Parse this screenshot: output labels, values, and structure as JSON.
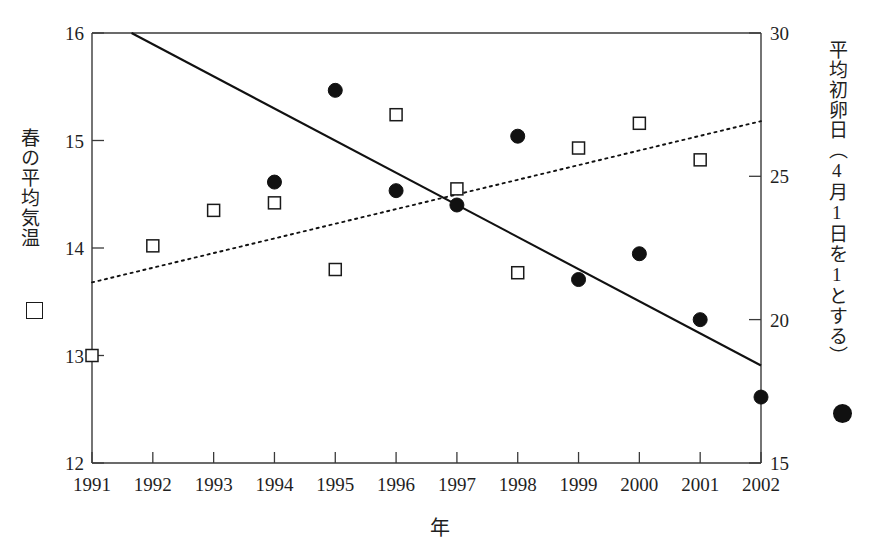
{
  "chart_data": {
    "type": "scatter",
    "title": "",
    "xlabel": "年",
    "x": [
      1991,
      1992,
      1993,
      1994,
      1995,
      1996,
      1997,
      1998,
      1999,
      2000,
      2001,
      2002
    ],
    "xtick_labels": [
      "1991",
      "1992",
      "1993",
      "1994",
      "1995",
      "1996",
      "1997",
      "1998",
      "1999",
      "2000",
      "2001",
      "2002"
    ],
    "xlim": [
      1991,
      2002
    ],
    "grid": false,
    "legend_position": "outside-left-and-right",
    "left_axis": {
      "label": "春の平均気温",
      "marker": "open-square",
      "ylim": [
        12,
        16
      ],
      "ticks": [
        12,
        13,
        14,
        15,
        16
      ],
      "tick_labels": [
        "12",
        "13",
        "14",
        "15",
        "16"
      ]
    },
    "right_axis": {
      "label": "平均初卵日（4月1日を1とする）",
      "marker": "filled-circle",
      "ylim": [
        15,
        30
      ],
      "ticks": [
        15,
        20,
        25,
        30
      ],
      "tick_labels": [
        "15",
        "20",
        "25",
        "30"
      ]
    },
    "series": [
      {
        "name": "春の平均気温",
        "axis": "left",
        "marker": "open-square",
        "x": [
          1991,
          1992,
          1993,
          1994,
          1995,
          1996,
          1997,
          1998,
          1999,
          2000,
          2001
        ],
        "values": [
          13.0,
          14.02,
          14.35,
          14.42,
          13.8,
          15.24,
          14.55,
          13.77,
          14.93,
          15.16,
          14.82
        ]
      },
      {
        "name": "平均初卵日",
        "axis": "right",
        "marker": "filled-circle",
        "x": [
          1994,
          1995,
          1996,
          1997,
          1998,
          1999,
          2000,
          2001,
          2002
        ],
        "values": [
          24.8,
          28.0,
          24.5,
          24.0,
          26.4,
          21.4,
          22.3,
          20.0,
          17.3
        ]
      }
    ],
    "trendlines": [
      {
        "name": "初卵日の回帰直線",
        "style": "solid",
        "axis": "right",
        "x": [
          1991.65,
          2002.0
        ],
        "values": [
          30.0,
          18.4
        ]
      },
      {
        "name": "平均気温の回帰直線",
        "style": "dotted",
        "axis": "left",
        "x": [
          1991.0,
          2002.0
        ],
        "values": [
          13.68,
          15.18
        ]
      }
    ]
  }
}
